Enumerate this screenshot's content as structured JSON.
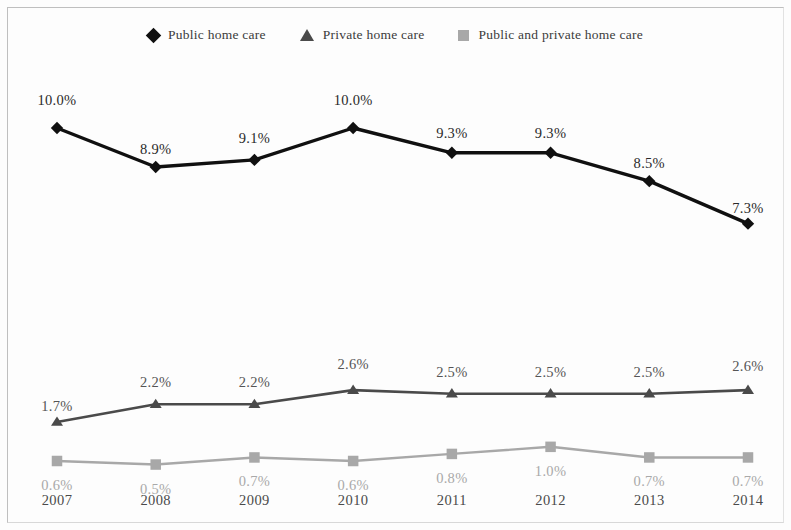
{
  "chart_data": {
    "type": "line",
    "title": "",
    "xlabel": "",
    "ylabel": "",
    "grid": false,
    "legend_position": "top-center",
    "value_suffix": "%",
    "categories": [
      "2007",
      "2008",
      "2009",
      "2010",
      "2011",
      "2012",
      "2013",
      "2014"
    ],
    "ylim": [
      0,
      11
    ],
    "series": [
      {
        "name": "Public home care",
        "marker": "diamond",
        "color": "#101010",
        "values": [
          10.0,
          8.9,
          9.1,
          10.0,
          9.3,
          9.3,
          8.5,
          7.3
        ],
        "labels": [
          "10.0%",
          "8.9%",
          "9.1%",
          "10.0%",
          "9.3%",
          "9.3%",
          "8.5%",
          "7.3%"
        ]
      },
      {
        "name": "Private home care",
        "marker": "triangle",
        "color": "#4a4a4a",
        "values": [
          1.7,
          2.2,
          2.2,
          2.6,
          2.5,
          2.5,
          2.5,
          2.6
        ],
        "labels": [
          "1.7%",
          "2.2%",
          "2.2%",
          "2.6%",
          "2.5%",
          "2.5%",
          "2.5%",
          "2.6%"
        ]
      },
      {
        "name": "Public and private home care",
        "marker": "square",
        "color": "#a8a8a8",
        "values": [
          0.6,
          0.5,
          0.7,
          0.6,
          0.8,
          1.0,
          0.7,
          0.7
        ],
        "labels": [
          "0.6%",
          "0.5%",
          "0.7%",
          "0.6%",
          "0.8%",
          "1.0%",
          "0.7%",
          "0.7%"
        ]
      }
    ]
  },
  "legend": {
    "items": [
      {
        "label": "Public home care",
        "icon": "diamond-marker-icon"
      },
      {
        "label": "Private home care",
        "icon": "triangle-marker-icon"
      },
      {
        "label": "Public and private home care",
        "icon": "square-marker-icon"
      }
    ]
  }
}
